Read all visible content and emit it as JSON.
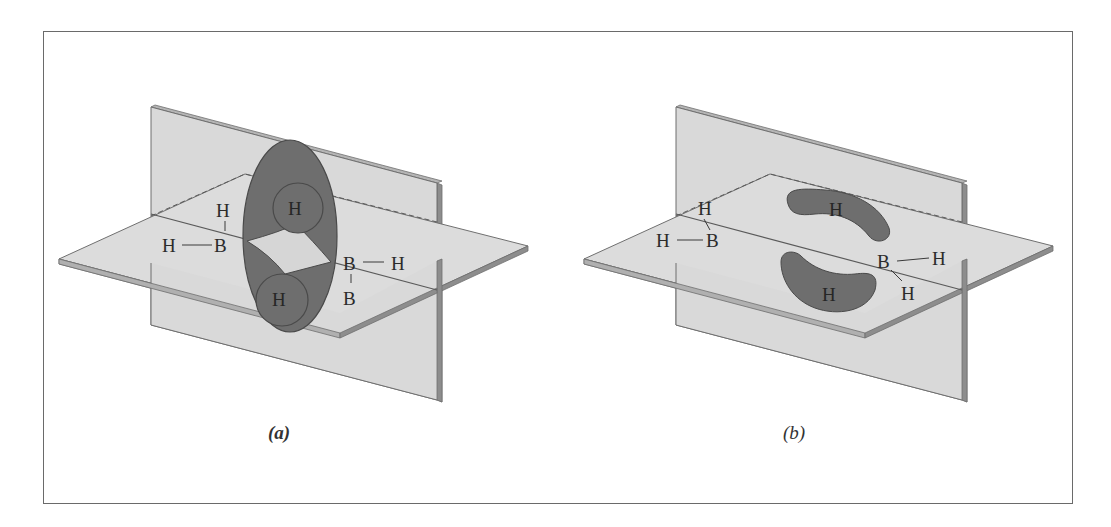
{
  "figure": {
    "panels": [
      {
        "id": "a",
        "caption": "(a)",
        "description": "Diborane B2H6 with two banana-shaped three-center B-H-B bonds drawn as a single elliptical electron cloud around bridging hydrogens",
        "atoms": {
          "terminal_h_top": "H",
          "terminal_h_left": "H",
          "boron_left": "B",
          "bridge_h_top": "H",
          "bridge_h_bottom": "H",
          "boron_right": "B",
          "terminal_h_right": "H",
          "boron_right_lower": "B"
        }
      },
      {
        "id": "b",
        "caption": "(b)",
        "description": "Diborane B2H6 with two separate banana-shaped bridging B-H-B bonds",
        "atoms": {
          "terminal_h_top": "H",
          "terminal_h_left": "H",
          "boron_left": "B",
          "bridge_h_top": "H",
          "bridge_h_bottom": "H",
          "boron_right": "B",
          "terminal_h_right": "H",
          "terminal_h_right_lower": "H"
        }
      }
    ],
    "colors": {
      "plane_fill": "#d9d9d9",
      "plane_edge": "#6f6f6f",
      "plane_thickness": "#9a9a9a",
      "orbital_fill": "#6e6e6e",
      "orbital_edge": "#4a4a4a",
      "frame": "#6a6a6a"
    }
  }
}
